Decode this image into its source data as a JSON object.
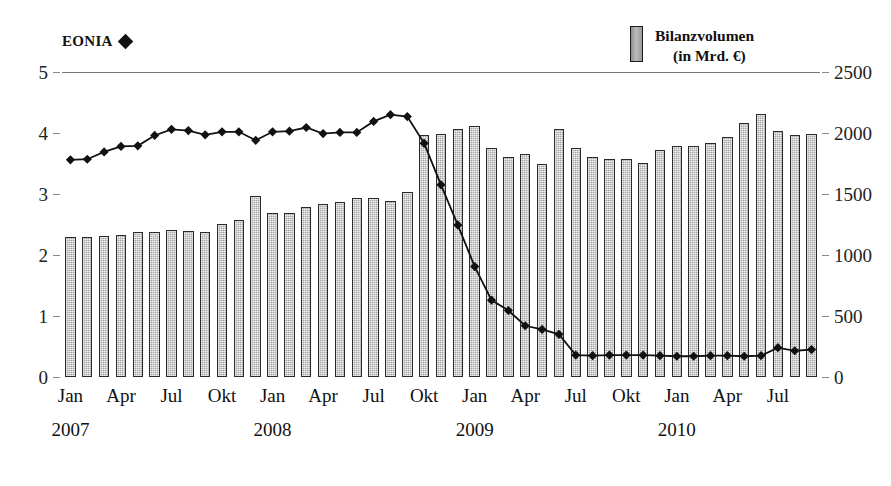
{
  "legend": {
    "eonia_label": "EONIA",
    "eonia_marker": "diamond-marker",
    "volume_label_line1": "Bilanzvolumen",
    "volume_label_line2": "(in Mrd. €)",
    "volume_marker": "bar-swatch"
  },
  "chart_data": {
    "type": "bar",
    "title": "",
    "xlabel": "",
    "ylabel": "",
    "grid": false,
    "legend_position": "top",
    "x": [
      "Jan 2007",
      "Feb 2007",
      "Mrz 2007",
      "Apr 2007",
      "Mai 2007",
      "Jun 2007",
      "Jul 2007",
      "Aug 2007",
      "Sep 2007",
      "Okt 2007",
      "Nov 2007",
      "Dez 2007",
      "Jan 2008",
      "Feb 2008",
      "Mrz 2008",
      "Apr 2008",
      "Mai 2008",
      "Jun 2008",
      "Jul 2008",
      "Aug 2008",
      "Sep 2008",
      "Okt 2008",
      "Nov 2008",
      "Dez 2008",
      "Jan 2009",
      "Feb 2009",
      "Mrz 2009",
      "Apr 2009",
      "Mai 2009",
      "Jun 2009",
      "Jul 2009",
      "Aug 2009",
      "Sep 2009",
      "Okt 2009",
      "Nov 2009",
      "Dez 2009",
      "Jan 2010",
      "Feb 2010",
      "Mrz 2010",
      "Apr 2010",
      "Mai 2010",
      "Jun 2010",
      "Jul 2010",
      "Aug 2010",
      "Sep 2010"
    ],
    "tick_labels": [
      {
        "index": 0,
        "month": "Jan",
        "year": "2007"
      },
      {
        "index": 3,
        "month": "Apr",
        "year": ""
      },
      {
        "index": 6,
        "month": "Jul",
        "year": ""
      },
      {
        "index": 9,
        "month": "Okt",
        "year": ""
      },
      {
        "index": 12,
        "month": "Jan",
        "year": "2008"
      },
      {
        "index": 15,
        "month": "Apr",
        "year": ""
      },
      {
        "index": 18,
        "month": "Jul",
        "year": ""
      },
      {
        "index": 21,
        "month": "Okt",
        "year": ""
      },
      {
        "index": 24,
        "month": "Jan",
        "year": "2009"
      },
      {
        "index": 27,
        "month": "Apr",
        "year": ""
      },
      {
        "index": 30,
        "month": "Jul",
        "year": ""
      },
      {
        "index": 33,
        "month": "Okt",
        "year": ""
      },
      {
        "index": 36,
        "month": "Jan",
        "year": "2010"
      },
      {
        "index": 39,
        "month": "Apr",
        "year": ""
      },
      {
        "index": 42,
        "month": "Jul",
        "year": ""
      }
    ],
    "left_axis": {
      "name": "EONIA",
      "ylim": [
        0,
        5
      ],
      "ticks": [
        0,
        1,
        2,
        3,
        4,
        5
      ],
      "tick_labels": [
        "0",
        "1",
        "2",
        "3",
        "4",
        "5"
      ]
    },
    "right_axis": {
      "name": "Bilanzvolumen (in Mrd. €)",
      "ylim": [
        0,
        2500
      ],
      "ticks": [
        0,
        500,
        1000,
        1500,
        2000,
        2500
      ],
      "tick_labels": [
        "0",
        "500",
        "1000",
        "1500",
        "2000",
        "2500"
      ]
    },
    "series": [
      {
        "name": "Bilanzvolumen",
        "type": "bar",
        "axis": "right",
        "unit": "Mrd. €",
        "color": "#a4a4a4",
        "values": [
          1150,
          1150,
          1155,
          1165,
          1185,
          1185,
          1205,
          1200,
          1185,
          1255,
          1290,
          1480,
          1345,
          1345,
          1395,
          1420,
          1435,
          1465,
          1470,
          1445,
          1520,
          1980,
          1990,
          2035,
          2055,
          1875,
          1800,
          1830,
          1750,
          2030,
          1875,
          1800,
          1790,
          1790,
          1755,
          1860,
          1890,
          1895,
          1915,
          1965,
          2080,
          2155,
          2020,
          1985,
          1990
        ]
      },
      {
        "name": "EONIA",
        "type": "line",
        "axis": "left",
        "unit": "%",
        "color": "#111111",
        "marker": "diamond",
        "values": [
          3.56,
          3.57,
          3.69,
          3.78,
          3.79,
          3.96,
          4.06,
          4.04,
          3.97,
          4.02,
          4.02,
          3.88,
          4.02,
          4.03,
          4.09,
          3.99,
          4.01,
          4.01,
          4.19,
          4.3,
          4.27,
          3.83,
          3.15,
          2.49,
          1.81,
          1.26,
          1.09,
          0.84,
          0.78,
          0.7,
          0.36,
          0.35,
          0.36,
          0.36,
          0.36,
          0.35,
          0.34,
          0.34,
          0.35,
          0.35,
          0.34,
          0.35,
          0.48,
          0.43,
          0.45
        ]
      }
    ]
  }
}
